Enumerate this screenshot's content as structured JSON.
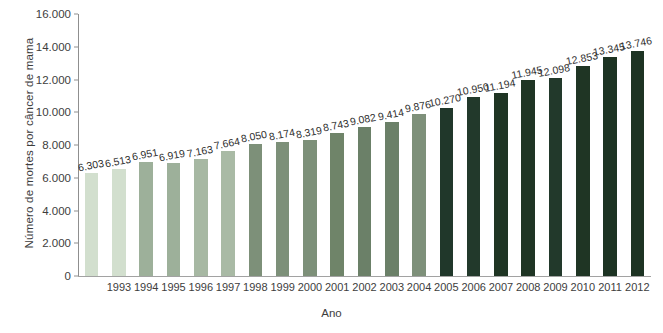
{
  "chart_data": {
    "type": "bar",
    "title": "",
    "xlabel": "Ano",
    "ylabel": "Número de mortes por câncer de mama",
    "ylim": [
      0,
      16000
    ],
    "ytick_labels": [
      "0",
      "2.000",
      "4.000",
      "6.000",
      "8.000",
      "10.000",
      "12.000",
      "14.000",
      "16.000"
    ],
    "ytick_values": [
      0,
      2000,
      4000,
      6000,
      8000,
      10000,
      12000,
      14000,
      16000
    ],
    "grid": false,
    "legend": "none",
    "categories": [
      "",
      "1993",
      "1994",
      "1995",
      "1996",
      "1997",
      "1998",
      "1999",
      "2000",
      "2001",
      "2002",
      "2003",
      "2004",
      "2005",
      "2006",
      "2007",
      "2008",
      "2009",
      "2010",
      "2011",
      "2012"
    ],
    "values": [
      6303,
      6513,
      6951,
      6919,
      7163,
      7664,
      8050,
      8174,
      8319,
      8743,
      9082,
      9414,
      9876,
      10270,
      10950,
      11194,
      11945,
      12098,
      12853,
      13345,
      13746
    ],
    "data_labels": [
      "6.303",
      "6.513",
      "6.951",
      "6.919",
      "7.163",
      "7.664",
      "8.050",
      "8.174",
      "8.319",
      "8.743",
      "9.082",
      "9.414",
      "9.876",
      "10.270",
      "10.950",
      "11.194",
      "11.945",
      "12.098",
      "12.853",
      "13.345",
      "13.746"
    ],
    "bar_colors": [
      "#d2dfce",
      "#d2dfce",
      "#9db09a",
      "#9db09a",
      "#a7b8a3",
      "#a9baa5",
      "#7d9079",
      "#7d9079",
      "#7d9079",
      "#6f8469",
      "#6b8068",
      "#6b8068",
      "#7e907a",
      "#20372a",
      "#22392b",
      "#1f3524",
      "#1f3524",
      "#22392b",
      "#1f3524",
      "#1d3323",
      "#1d3323"
    ]
  }
}
